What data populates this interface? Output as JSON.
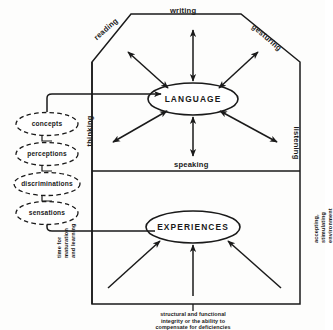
{
  "diagram": {
    "colors": {
      "ink": "#111111",
      "background": "#fdfdfc",
      "stroke": "#1a1a1a"
    },
    "nodes": {
      "language": "LANGUAGE",
      "experiences": "EXPERIENCES"
    },
    "edge_labels": {
      "writing": "writing",
      "reading": "reading",
      "gesturing": "gesturing",
      "listening": "listening",
      "thinking": "thinking",
      "speaking": "speaking"
    },
    "dashed_chain": [
      {
        "label": "concepts"
      },
      {
        "label": "perceptions"
      },
      {
        "label": "discriminations"
      },
      {
        "label": "sensations"
      }
    ],
    "input_labels": {
      "left": "time for maturation and learning",
      "left_lines": [
        "time for",
        "maturation",
        "and learning"
      ],
      "bottom": "structural and functional integrity or the ability to compensate for deficiencies",
      "bottom_lines": [
        "structural and functional",
        "integrity or the ability to",
        "compensate for deficiencies"
      ],
      "right": "accepting, stimulating environment",
      "right_lines": [
        "accepting,",
        "stimulating",
        "environment"
      ]
    }
  }
}
